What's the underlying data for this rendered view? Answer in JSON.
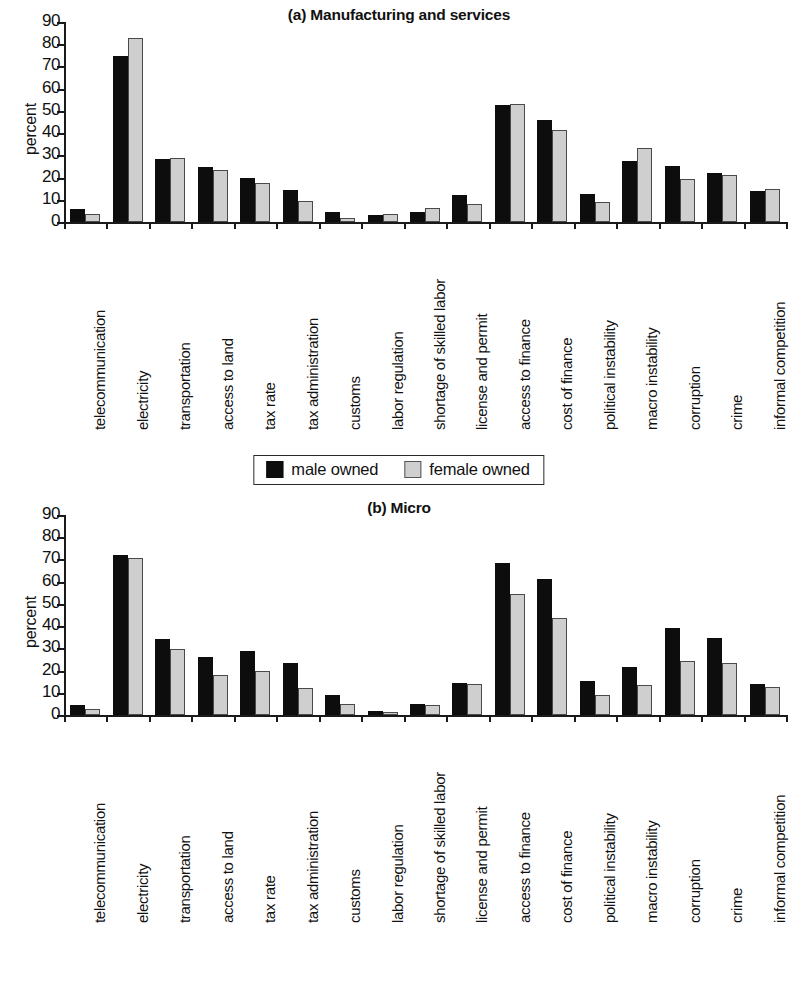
{
  "figure": {
    "y_axis_title": "percent",
    "legend": {
      "male_label": "male owned",
      "female_label": "female owned"
    },
    "y_ticks": [
      "0",
      "10",
      "20",
      "30",
      "40",
      "50",
      "60",
      "70",
      "80",
      "90"
    ],
    "colors": {
      "male": "#0d0d0d",
      "female": "#cfcfcf",
      "axis": "#1a1a1a",
      "background": "#ffffff"
    }
  },
  "chart_data": [
    {
      "type": "bar",
      "title": "(a) Manufacturing and services",
      "xlabel": "",
      "ylabel": "percent",
      "ylim": [
        0,
        90
      ],
      "grid": false,
      "legend_position": "bottom",
      "categories": [
        "telecommunication",
        "electricity",
        "transportation",
        "access to land",
        "tax rate",
        "tax administration",
        "customs",
        "labor regulation",
        "shortage of skilled labor",
        "license and permit",
        "access to finance",
        "cost of finance",
        "political instability",
        "macro instability",
        "corruption",
        "crime",
        "informal competition"
      ],
      "series": [
        {
          "name": "male owned",
          "values": [
            6,
            74.5,
            28.5,
            24.8,
            20,
            14.3,
            4.5,
            3.3,
            4.5,
            12,
            52.5,
            46,
            12.5,
            27.5,
            25.3,
            22,
            14
          ]
        },
        {
          "name": "female owned",
          "values": [
            3.5,
            83,
            29,
            23.5,
            17.5,
            9.3,
            2,
            3.5,
            6.3,
            8,
            53,
            41.5,
            9,
            33.5,
            19.3,
            21.3,
            15
          ]
        }
      ]
    },
    {
      "type": "bar",
      "title": "(b) Micro",
      "xlabel": "",
      "ylabel": "percent",
      "ylim": [
        0,
        90
      ],
      "grid": false,
      "legend_position": "bottom",
      "categories": [
        "telecommunication",
        "electricity",
        "transportation",
        "access to land",
        "tax rate",
        "tax administration",
        "customs",
        "labor regulation",
        "shortage of skilled labor",
        "license and permit",
        "access to finance",
        "cost of finance",
        "political instability",
        "macro instability",
        "corruption",
        "crime",
        "informal competition"
      ],
      "series": [
        {
          "name": "male owned",
          "values": [
            4.5,
            72,
            34,
            26.3,
            29,
            23.5,
            9,
            2,
            5,
            14.5,
            68.5,
            61,
            15.5,
            21.5,
            39,
            34.5,
            14
          ]
        },
        {
          "name": "female owned",
          "values": [
            2.5,
            70.5,
            29.5,
            18,
            20,
            12,
            5,
            1.5,
            4.5,
            14,
            54.5,
            43.5,
            9,
            13.5,
            24.5,
            23.5,
            12.5
          ]
        }
      ]
    }
  ]
}
